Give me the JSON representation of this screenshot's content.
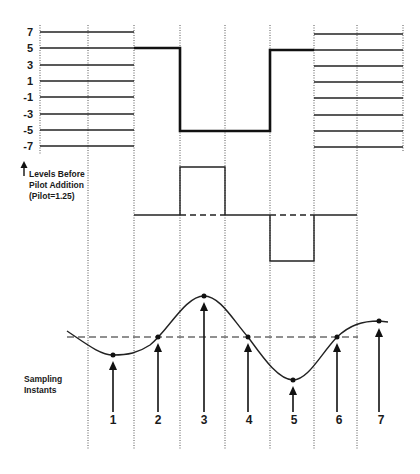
{
  "diagram": {
    "level_labels": [
      "7",
      "5",
      "3",
      "1",
      "-1",
      "-3",
      "-5",
      "-7"
    ],
    "levels_caption": {
      "line1": "Levels Before",
      "line2": "Pilot Addition",
      "line3": "(Pilot=1.25)"
    },
    "sampling_caption": {
      "line1": "Sampling",
      "line2": "Instants"
    },
    "sample_numbers": [
      "1",
      "2",
      "3",
      "4",
      "5",
      "6",
      "7"
    ],
    "colors": {
      "ink": "#1a1a1a",
      "grid": "#555555",
      "background": "#ffffff"
    }
  }
}
